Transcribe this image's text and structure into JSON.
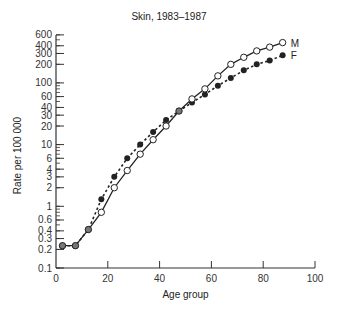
{
  "chart_data": {
    "type": "line",
    "title": "Skin, 1983–1987",
    "xlabel": "Age group",
    "ylabel": "Rate per 100 000",
    "yscale": "log",
    "xlim": [
      0,
      100
    ],
    "ylim": [
      0.1,
      600
    ],
    "x_ticks": [
      0,
      20,
      40,
      60,
      80,
      100
    ],
    "y_ticks": [
      0.1,
      0.2,
      0.3,
      0.4,
      0.6,
      1,
      2,
      3,
      4,
      6,
      10,
      20,
      30,
      40,
      60,
      100,
      200,
      300,
      400,
      600
    ],
    "y_tick_labels": [
      "0.1",
      "0.2",
      "0.3",
      "0.4",
      "0.6",
      "1",
      "2",
      "3",
      "4",
      "6",
      "10",
      "20",
      "30",
      "40",
      "60",
      "100",
      "200",
      "300",
      "400",
      "600"
    ],
    "grid": false,
    "x": [
      2.5,
      7.5,
      12.5,
      17.5,
      22.5,
      27.5,
      32.5,
      37.5,
      42.5,
      47.5,
      52.5,
      57.5,
      62.5,
      67.5,
      72.5,
      77.5,
      82.5,
      87.5
    ],
    "series": [
      {
        "name": "M",
        "style": "solid line, open circles",
        "values": [
          0.23,
          0.23,
          0.42,
          0.8,
          2,
          3.8,
          7,
          12,
          20,
          35,
          55,
          80,
          130,
          200,
          260,
          330,
          380,
          450
        ]
      },
      {
        "name": "F",
        "style": "dotted line, filled circles",
        "values": [
          0.23,
          0.23,
          0.42,
          1.3,
          3,
          6,
          10,
          16,
          25,
          35,
          48,
          65,
          90,
          120,
          160,
          200,
          230,
          280
        ]
      }
    ],
    "legend": "inline labels at line ends"
  }
}
